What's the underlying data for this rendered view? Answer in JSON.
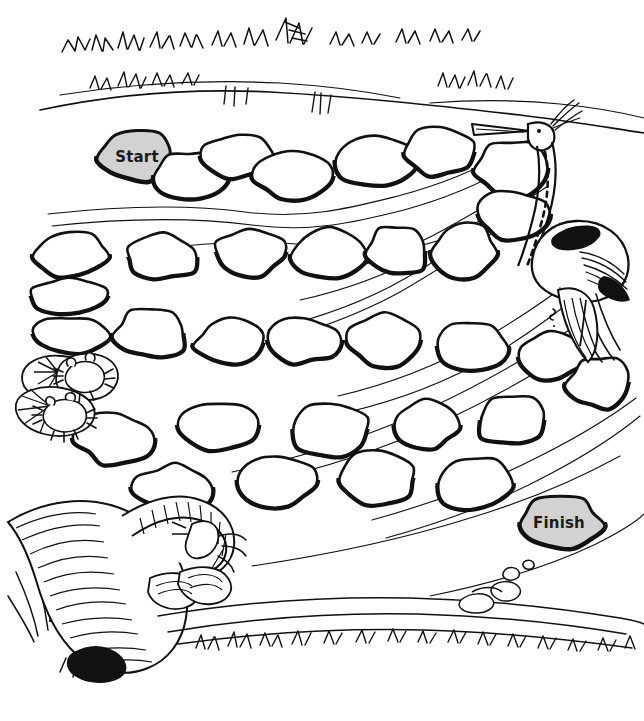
{
  "page": {
    "type": "black-and-white line-art activity worksheet",
    "background_color": "#ffffff",
    "ink_color": "#111111",
    "width": 644,
    "height": 721
  },
  "markers": {
    "start": {
      "label": "Start",
      "fill_color": "#d2d2d2",
      "stroke_color": "#111111",
      "x": 137,
      "y": 156
    },
    "finish": {
      "label": "Finish",
      "fill_color": "#d2d2d2",
      "stroke_color": "#111111",
      "x": 559,
      "y": 522
    }
  },
  "scenery": [
    {
      "name": "grass-bank-top",
      "description": "grass tufts along top bank"
    },
    {
      "name": "heron-bird",
      "description": "standing heron wading at right edge"
    },
    {
      "name": "lily-pad-frogs",
      "description": "two frogs sitting on lily pads at left"
    },
    {
      "name": "fallen-log",
      "description": "fallen striped log with branch at bottom left"
    },
    {
      "name": "cattails",
      "description": "cattail reeds at bottom left"
    },
    {
      "name": "pebbles-bank",
      "description": "small pebbles on bottom right bank"
    },
    {
      "name": "grass-bank-bottom",
      "description": "grass tufts along bottom bank"
    },
    {
      "name": "water-ripples",
      "description": "flowing water current lines across stream"
    }
  ],
  "stones": [
    {
      "id": 1,
      "cx": 137,
      "cy": 156,
      "rx": 38,
      "ry": 25,
      "seed": 11,
      "marker": "start"
    },
    {
      "id": 2,
      "cx": 190,
      "cy": 175,
      "rx": 38,
      "ry": 24,
      "seed": 23
    },
    {
      "id": 3,
      "cx": 240,
      "cy": 156,
      "rx": 36,
      "ry": 22,
      "seed": 31
    },
    {
      "id": 4,
      "cx": 292,
      "cy": 176,
      "rx": 38,
      "ry": 23,
      "seed": 42
    },
    {
      "id": 5,
      "cx": 375,
      "cy": 160,
      "rx": 38,
      "ry": 25,
      "seed": 57
    },
    {
      "id": 6,
      "cx": 440,
      "cy": 152,
      "rx": 36,
      "ry": 24,
      "seed": 63
    },
    {
      "id": 7,
      "cx": 511,
      "cy": 168,
      "rx": 37,
      "ry": 27,
      "seed": 78
    },
    {
      "id": 8,
      "cx": 69,
      "cy": 254,
      "rx": 38,
      "ry": 22,
      "seed": 84
    },
    {
      "id": 9,
      "cx": 164,
      "cy": 257,
      "rx": 37,
      "ry": 22,
      "seed": 95
    },
    {
      "id": 10,
      "cx": 249,
      "cy": 252,
      "rx": 36,
      "ry": 24,
      "seed": 106
    },
    {
      "id": 11,
      "cx": 329,
      "cy": 254,
      "rx": 35,
      "ry": 25,
      "seed": 117
    },
    {
      "id": 12,
      "cx": 397,
      "cy": 251,
      "rx": 30,
      "ry": 25,
      "seed": 128
    },
    {
      "id": 13,
      "cx": 464,
      "cy": 250,
      "rx": 33,
      "ry": 26,
      "seed": 139
    },
    {
      "id": 14,
      "cx": 512,
      "cy": 214,
      "rx": 34,
      "ry": 25,
      "seed": 150
    },
    {
      "id": 15,
      "cx": 69,
      "cy": 296,
      "rx": 40,
      "ry": 18,
      "seed": 161
    },
    {
      "id": 16,
      "cx": 69,
      "cy": 334,
      "rx": 40,
      "ry": 18,
      "seed": 172
    },
    {
      "id": 17,
      "cx": 152,
      "cy": 333,
      "rx": 36,
      "ry": 24,
      "seed": 183
    },
    {
      "id": 18,
      "cx": 229,
      "cy": 343,
      "rx": 34,
      "ry": 23,
      "seed": 194
    },
    {
      "id": 19,
      "cx": 304,
      "cy": 340,
      "rx": 35,
      "ry": 23,
      "seed": 205
    },
    {
      "id": 20,
      "cx": 385,
      "cy": 340,
      "rx": 39,
      "ry": 26,
      "seed": 216
    },
    {
      "id": 21,
      "cx": 472,
      "cy": 346,
      "rx": 37,
      "ry": 25,
      "seed": 227
    },
    {
      "id": 22,
      "cx": 549,
      "cy": 357,
      "rx": 34,
      "ry": 25,
      "seed": 238
    },
    {
      "id": 23,
      "cx": 599,
      "cy": 382,
      "rx": 31,
      "ry": 26,
      "seed": 249
    },
    {
      "id": 24,
      "cx": 115,
      "cy": 438,
      "rx": 39,
      "ry": 25,
      "seed": 260
    },
    {
      "id": 25,
      "cx": 222,
      "cy": 425,
      "rx": 43,
      "ry": 25,
      "seed": 271
    },
    {
      "id": 26,
      "cx": 330,
      "cy": 429,
      "rx": 38,
      "ry": 26,
      "seed": 282
    },
    {
      "id": 27,
      "cx": 425,
      "cy": 425,
      "rx": 33,
      "ry": 24,
      "seed": 293
    },
    {
      "id": 28,
      "cx": 512,
      "cy": 420,
      "rx": 36,
      "ry": 25,
      "seed": 304
    },
    {
      "id": 29,
      "cx": 175,
      "cy": 487,
      "rx": 39,
      "ry": 23,
      "seed": 315
    },
    {
      "id": 30,
      "cx": 277,
      "cy": 480,
      "rx": 37,
      "ry": 26,
      "seed": 326
    },
    {
      "id": 31,
      "cx": 378,
      "cy": 478,
      "rx": 38,
      "ry": 27,
      "seed": 337
    },
    {
      "id": 32,
      "cx": 475,
      "cy": 483,
      "rx": 38,
      "ry": 28,
      "seed": 348
    },
    {
      "id": 33,
      "cx": 559,
      "cy": 522,
      "rx": 42,
      "ry": 26,
      "seed": 359,
      "marker": "finish"
    }
  ]
}
